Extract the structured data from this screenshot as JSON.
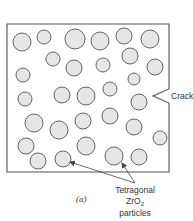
{
  "figure": {
    "caption_label": "(a)",
    "crack_label": "Crack",
    "particles_label": {
      "line1": "Tetragonal",
      "line2_prefix": "ZrO",
      "line2_subscript": "2",
      "line3": "particles"
    },
    "colors": {
      "particle_fill": "#e6e6e6",
      "particle_stroke": "#555555",
      "box_stroke": "#555555",
      "text": "#333333"
    }
  },
  "specimen": {
    "box": {
      "x": 7,
      "y": 24,
      "right": 169,
      "bottom": 172
    },
    "crack": {
      "top_y": 89,
      "tip_x": 153,
      "tip_y": 96,
      "bottom_y": 103
    },
    "particles": [
      {
        "cx": 22,
        "cy": 42,
        "r": 9
      },
      {
        "cx": 44,
        "cy": 37,
        "r": 7
      },
      {
        "cx": 75,
        "cy": 39,
        "r": 10
      },
      {
        "cx": 100,
        "cy": 41,
        "r": 9
      },
      {
        "cx": 124,
        "cy": 36,
        "r": 8
      },
      {
        "cx": 150,
        "cy": 39,
        "r": 9
      },
      {
        "cx": 53,
        "cy": 59,
        "r": 7
      },
      {
        "cx": 74,
        "cy": 68,
        "r": 8
      },
      {
        "cx": 103,
        "cy": 65,
        "r": 7
      },
      {
        "cx": 130,
        "cy": 56,
        "r": 8
      },
      {
        "cx": 155,
        "cy": 67,
        "r": 8
      },
      {
        "cx": 23,
        "cy": 75,
        "r": 7
      },
      {
        "cx": 134,
        "cy": 79,
        "r": 6
      },
      {
        "cx": 62,
        "cy": 95,
        "r": 8
      },
      {
        "cx": 86,
        "cy": 96,
        "r": 9
      },
      {
        "cx": 110,
        "cy": 89,
        "r": 7
      },
      {
        "cx": 139,
        "cy": 102,
        "r": 8
      },
      {
        "cx": 25,
        "cy": 99,
        "r": 7
      },
      {
        "cx": 34,
        "cy": 123,
        "r": 9
      },
      {
        "cx": 83,
        "cy": 121,
        "r": 8
      },
      {
        "cx": 110,
        "cy": 116,
        "r": 8
      },
      {
        "cx": 59,
        "cy": 130,
        "r": 9
      },
      {
        "cx": 134,
        "cy": 127,
        "r": 8
      },
      {
        "cx": 160,
        "cy": 138,
        "r": 7
      },
      {
        "cx": 26,
        "cy": 146,
        "r": 8
      },
      {
        "cx": 86,
        "cy": 146,
        "r": 9
      },
      {
        "cx": 38,
        "cy": 161,
        "r": 8
      },
      {
        "cx": 63,
        "cy": 159,
        "r": 8
      },
      {
        "cx": 114,
        "cy": 156,
        "r": 9
      },
      {
        "cx": 139,
        "cy": 157,
        "r": 8
      }
    ],
    "pointer_targets": [
      {
        "x": 70,
        "y": 162
      },
      {
        "x": 122,
        "y": 163
      }
    ],
    "pointer_origin": {
      "x": 135,
      "y": 183
    }
  }
}
